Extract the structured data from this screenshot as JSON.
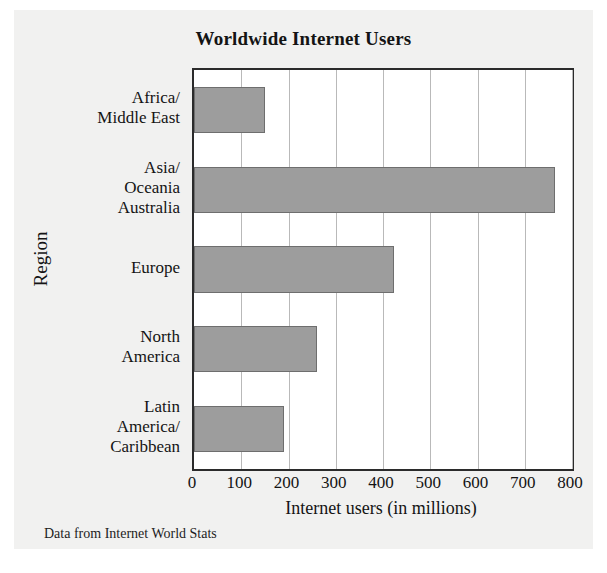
{
  "figure": {
    "background_color": "#f1f1f0",
    "plot_background_color": "#ffffff",
    "bar_color": "#9d9d9d",
    "axis_color": "#2b2b2b",
    "gridline_color": "#b9b9b9"
  },
  "source_caption": "Data from Internet World Stats",
  "chart_data": {
    "type": "bar",
    "orientation": "horizontal",
    "title": "Worldwide Internet Users",
    "xlabel": "Internet users (in millions)",
    "ylabel": "Region",
    "categories": [
      "Africa/\nMiddle East",
      "Asia/\nOceania\nAustralia",
      "Europe",
      "North\nAmerica",
      "Latin\nAmerica/\nCaribbean"
    ],
    "category_lines": [
      [
        "Africa/",
        "Middle East"
      ],
      [
        "Asia/",
        "Oceania",
        "Australia"
      ],
      [
        "Europe"
      ],
      [
        "North",
        "America"
      ],
      [
        "Latin",
        "America/",
        "Caribbean"
      ]
    ],
    "values": [
      150,
      765,
      423,
      260,
      190
    ],
    "xlim": [
      0,
      800
    ],
    "xticks": [
      0,
      100,
      200,
      300,
      400,
      500,
      600,
      700,
      800
    ],
    "xtick_labels": [
      "0",
      "100",
      "200",
      "300",
      "400",
      "500",
      "600",
      "700",
      "800"
    ],
    "grid": "vertical",
    "legend": "none"
  }
}
